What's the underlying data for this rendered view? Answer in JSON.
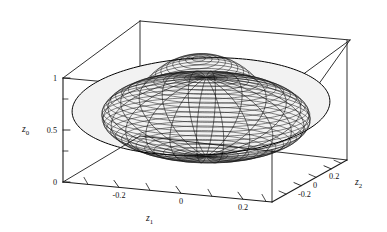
{
  "figure": {
    "kind": "3d-wireframe-ellipsoid-plot",
    "background_color": "#ffffff",
    "line_color": "#111111",
    "surface_fill": "#f2f2f2"
  },
  "axes": {
    "vertical": {
      "name": "z0",
      "title": "z",
      "subscript": "0",
      "tick_labels": [
        "1",
        "0.5",
        "0"
      ],
      "tick_values": [
        1,
        0.5,
        0
      ],
      "range": [
        0,
        1
      ]
    },
    "bottom_front": {
      "name": "z1",
      "title": "z",
      "subscript": "1",
      "tick_labels": [
        "-0.2",
        "0",
        "0.2"
      ],
      "tick_values": [
        -0.2,
        0,
        0.2
      ],
      "range": [
        -0.32,
        0.32
      ]
    },
    "bottom_right": {
      "name": "z2",
      "title": "z",
      "subscript": "2",
      "tick_labels": [
        "-0.2",
        "0",
        "0.2"
      ],
      "tick_values": [
        -0.2,
        0,
        0.2
      ],
      "range": [
        -0.32,
        0.32
      ]
    }
  },
  "chart_data": {
    "type": "surface",
    "title": "",
    "xlabel": "z1",
    "ylabel": "z2",
    "zlabel": "z0",
    "grid": false,
    "legend": null,
    "surface": {
      "shape": "ellipsoid",
      "center": [
        0.0,
        0.0,
        0.5
      ],
      "semi_axes": {
        "z1": 0.3,
        "z2": 0.3,
        "z0": 0.38
      },
      "mesh_meridians": 24,
      "mesh_parallels": 30,
      "wireframe": true
    },
    "xlim": [
      -0.32,
      0.32
    ],
    "ylim": [
      -0.32,
      0.32
    ],
    "zlim": [
      0,
      1
    ],
    "xticks": [
      -0.2,
      0,
      0.2
    ],
    "yticks": [
      -0.2,
      0,
      0.2
    ],
    "zticks": [
      0,
      0.5,
      1
    ],
    "xticklabels": [
      "-0.2",
      "0",
      "0.2"
    ],
    "yticklabels": [
      "-0.2",
      "0",
      "0.2"
    ],
    "zticklabels": [
      "0",
      "0.5",
      "1"
    ]
  }
}
